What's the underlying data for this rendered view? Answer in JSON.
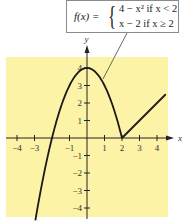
{
  "chart_data": {
    "type": "line",
    "title": "",
    "xlabel": "x",
    "ylabel": "y",
    "xlim": [
      -4.5,
      4.5
    ],
    "ylim": [
      -4.5,
      4.5
    ],
    "grid": false,
    "x_ticks": [
      -4,
      -3,
      -1,
      1,
      2,
      3,
      4
    ],
    "y_ticks": [
      -4,
      -3,
      -2,
      -1,
      1,
      2,
      3,
      4
    ],
    "x_tick_labels": [
      "−4",
      "−3",
      "−1",
      "1",
      "2",
      "3",
      "4"
    ],
    "y_tick_labels": [
      "−4",
      "−3",
      "−2",
      "−1",
      "1",
      "2",
      "3",
      "4"
    ],
    "series": [
      {
        "name": "4 − x² (x < 2)",
        "x": [
          -2.95,
          -2.5,
          -2,
          -1.5,
          -1,
          -0.5,
          0,
          0.5,
          1,
          1.5,
          2
        ],
        "y": [
          -4.7,
          -2.25,
          0,
          1.75,
          3,
          3.75,
          4,
          3.75,
          3,
          1.75,
          0
        ]
      },
      {
        "name": "x − 2 (x ≥ 2)",
        "x": [
          2,
          4.5
        ],
        "y": [
          0,
          2.5
        ]
      }
    ],
    "annotation": {
      "function_name": "f(x) =",
      "case1_expr": "4 − x² if x < 2",
      "case2_expr": "x − 2  if x ≥ 2"
    },
    "colors": {
      "background_region": "#fdf3a6",
      "curve": "#1a1a1a",
      "axis": "#222222"
    }
  },
  "formula": {
    "lhs": "f(x) =",
    "case1": "4 − x² if x < 2",
    "case2": "x − 2   if x ≥ 2"
  },
  "axes": {
    "x_name": "x",
    "y_name": "y"
  }
}
